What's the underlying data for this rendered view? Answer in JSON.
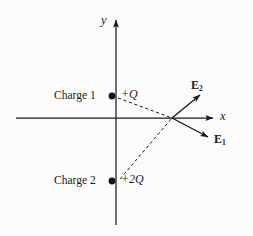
{
  "figure": {
    "type": "physics-vector-diagram",
    "background_color": "#fbfbfb",
    "stroke_color": "#1a1a1a",
    "width": 253,
    "height": 236
  },
  "axes": {
    "x_label": "x",
    "y_label": "y",
    "origin": {
      "x": 116,
      "y": 118
    },
    "x_axis": {
      "start_x": 16,
      "end_x": 215,
      "y": 118,
      "arrow": "right"
    },
    "y_axis": {
      "x": 116,
      "start_y": 225,
      "end_y": 18,
      "arrow": "up"
    }
  },
  "charges": [
    {
      "name": "Charge 1",
      "value": "+Q",
      "point": {
        "x": 112,
        "y": 96
      }
    },
    {
      "name": "Charge 2",
      "value": "+2Q",
      "point": {
        "x": 112,
        "y": 181
      }
    }
  ],
  "field_point": {
    "x": 172,
    "y": 118
  },
  "vectors": [
    {
      "label": "E",
      "subscript": "1",
      "from": {
        "x": 172,
        "y": 118
      },
      "to": {
        "x": 208,
        "y": 137
      },
      "style": "solid-arrow",
      "source_charge": "Charge 2"
    },
    {
      "label": "E",
      "subscript": "2",
      "from": {
        "x": 172,
        "y": 118
      },
      "to": {
        "x": 200,
        "y": 95
      },
      "style": "solid-arrow",
      "source_charge": "Charge 1"
    }
  ],
  "dashed_lines": [
    {
      "name": "charge-1-to-field-point",
      "from": {
        "x": 118,
        "y": 98
      },
      "to": {
        "x": 172,
        "y": 118
      }
    },
    {
      "name": "charge-2-to-field-point",
      "from": {
        "x": 120,
        "y": 179
      },
      "to": {
        "x": 172,
        "y": 118
      }
    }
  ]
}
